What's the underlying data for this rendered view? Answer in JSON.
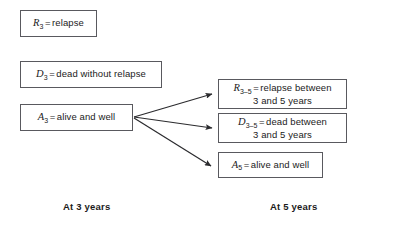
{
  "diagram": {
    "type": "state-transition-diagram",
    "stroke_color": "#59595e",
    "text_color": "#1b1b1b",
    "background": "#ffffff",
    "states_at_3_years": [
      {
        "id": "R3",
        "symbol": "R",
        "subscript": "3",
        "equals": "=",
        "definition": "relapse",
        "line2": ""
      },
      {
        "id": "D3",
        "symbol": "D",
        "subscript": "3",
        "equals": "=",
        "definition": "dead without relapse",
        "line2": ""
      },
      {
        "id": "A3",
        "symbol": "A",
        "subscript": "3",
        "equals": "=",
        "definition": "alive and well",
        "line2": ""
      }
    ],
    "states_at_5_years": [
      {
        "id": "R3-5",
        "symbol": "R",
        "subscript": "3–5",
        "equals": "=",
        "definition": "relapse between",
        "line2": "3 and 5 years"
      },
      {
        "id": "D3-5",
        "symbol": "D",
        "subscript": "3–5",
        "equals": "=",
        "definition": "dead between",
        "line2": "3 and 5 years"
      },
      {
        "id": "A5",
        "symbol": "A",
        "subscript": "5",
        "equals": "=",
        "definition": "alive and well",
        "line2": ""
      }
    ],
    "transitions": [
      {
        "from": "A3",
        "to": "R3-5"
      },
      {
        "from": "A3",
        "to": "D3-5"
      },
      {
        "from": "A3",
        "to": "A5"
      }
    ],
    "captions": {
      "left": "At 3 years",
      "right": "At 5 years"
    }
  }
}
